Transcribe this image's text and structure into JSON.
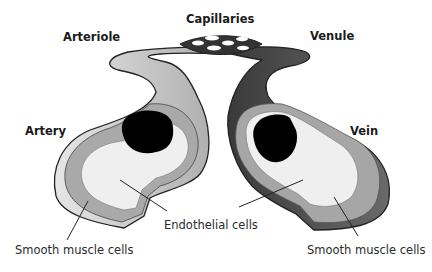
{
  "figure": {
    "labels": {
      "capillaries": "Capillaries",
      "arteriole": "Arteriole",
      "venule": "Venule",
      "artery": "Artery",
      "vein": "Vein",
      "endothelial": "Endothelial cells",
      "smooth_muscle_left": "Smooth muscle cells",
      "smooth_muscle_right": "Smooth muscle cells"
    },
    "colors": {
      "artery_outer": "#c8c8c8",
      "artery_muscle": "#a9a9a9",
      "endothelium": "#efefef",
      "lumen": "#000000",
      "vein_outer": "#4a4a4a",
      "vein_muscle": "#a6a6a6",
      "outline": "#222222"
    }
  }
}
